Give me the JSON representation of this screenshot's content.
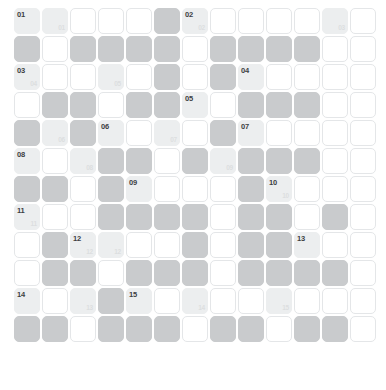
{
  "grid": {
    "columns": 13,
    "rows": 11,
    "colors": {
      "background": "#ffffff",
      "empty_cell": "#ffffff",
      "blocked_cell": "#c9cbcd",
      "clue_cell": "#eceeef",
      "cell_border": "#e4e6e8",
      "number_main": "#3d4043",
      "number_echo": "#dcdee0"
    },
    "legend": {
      "empty": "white fillable answer cell",
      "block": "shaded blocked cell",
      "clue": "light tinted numbered clue cell"
    },
    "cells": [
      [
        {
          "type": "clue",
          "num": "01"
        },
        {
          "type": "clue",
          "echo": "01"
        },
        {
          "type": "white"
        },
        {
          "type": "white"
        },
        {
          "type": "white"
        },
        {
          "type": "block"
        },
        {
          "type": "clue",
          "num": "02",
          "echo": "02"
        },
        {
          "type": "white"
        },
        {
          "type": "white"
        },
        {
          "type": "white"
        },
        {
          "type": "white"
        },
        {
          "type": "clue",
          "echo": "03"
        },
        {
          "type": "white"
        }
      ],
      [
        {
          "type": "block"
        },
        {
          "type": "white"
        },
        {
          "type": "block"
        },
        {
          "type": "block"
        },
        {
          "type": "block"
        },
        {
          "type": "block"
        },
        {
          "type": "white"
        },
        {
          "type": "block"
        },
        {
          "type": "block"
        },
        {
          "type": "block"
        },
        {
          "type": "block"
        },
        {
          "type": "white"
        },
        {
          "type": "white"
        }
      ],
      [
        {
          "type": "clue",
          "num": "03",
          "echo": "04"
        },
        {
          "type": "white"
        },
        {
          "type": "white"
        },
        {
          "type": "clue",
          "echo": "05"
        },
        {
          "type": "white"
        },
        {
          "type": "block"
        },
        {
          "type": "white"
        },
        {
          "type": "block"
        },
        {
          "type": "clue",
          "num": "04"
        },
        {
          "type": "white"
        },
        {
          "type": "white"
        },
        {
          "type": "white"
        },
        {
          "type": "white"
        }
      ],
      [
        {
          "type": "white"
        },
        {
          "type": "block"
        },
        {
          "type": "block"
        },
        {
          "type": "white"
        },
        {
          "type": "block"
        },
        {
          "type": "block"
        },
        {
          "type": "clue",
          "num": "05"
        },
        {
          "type": "white"
        },
        {
          "type": "block"
        },
        {
          "type": "block"
        },
        {
          "type": "block"
        },
        {
          "type": "white"
        },
        {
          "type": "white"
        }
      ],
      [
        {
          "type": "block"
        },
        {
          "type": "clue",
          "echo": "06"
        },
        {
          "type": "block"
        },
        {
          "type": "clue",
          "num": "06"
        },
        {
          "type": "white"
        },
        {
          "type": "clue",
          "echo": "07"
        },
        {
          "type": "white"
        },
        {
          "type": "block"
        },
        {
          "type": "clue",
          "num": "07"
        },
        {
          "type": "white"
        },
        {
          "type": "white"
        },
        {
          "type": "white"
        },
        {
          "type": "white"
        }
      ],
      [
        {
          "type": "clue",
          "num": "08"
        },
        {
          "type": "white"
        },
        {
          "type": "clue",
          "echo": "08"
        },
        {
          "type": "block"
        },
        {
          "type": "block"
        },
        {
          "type": "white"
        },
        {
          "type": "block"
        },
        {
          "type": "clue",
          "echo": "09"
        },
        {
          "type": "block"
        },
        {
          "type": "block"
        },
        {
          "type": "block"
        },
        {
          "type": "white"
        },
        {
          "type": "white"
        }
      ],
      [
        {
          "type": "block"
        },
        {
          "type": "block"
        },
        {
          "type": "white"
        },
        {
          "type": "block"
        },
        {
          "type": "clue",
          "num": "09"
        },
        {
          "type": "white"
        },
        {
          "type": "white"
        },
        {
          "type": "white"
        },
        {
          "type": "block"
        },
        {
          "type": "clue",
          "num": "10",
          "echo": "10"
        },
        {
          "type": "white"
        },
        {
          "type": "white"
        },
        {
          "type": "white"
        }
      ],
      [
        {
          "type": "clue",
          "num": "11",
          "echo": "11"
        },
        {
          "type": "white"
        },
        {
          "type": "white"
        },
        {
          "type": "block"
        },
        {
          "type": "block"
        },
        {
          "type": "block"
        },
        {
          "type": "block"
        },
        {
          "type": "white"
        },
        {
          "type": "block"
        },
        {
          "type": "block"
        },
        {
          "type": "white"
        },
        {
          "type": "block"
        },
        {
          "type": "white"
        }
      ],
      [
        {
          "type": "white"
        },
        {
          "type": "block"
        },
        {
          "type": "clue",
          "num": "12",
          "echo": "12"
        },
        {
          "type": "clue",
          "echo": "12"
        },
        {
          "type": "white"
        },
        {
          "type": "white"
        },
        {
          "type": "block"
        },
        {
          "type": "white"
        },
        {
          "type": "block"
        },
        {
          "type": "block"
        },
        {
          "type": "clue",
          "num": "13"
        },
        {
          "type": "white"
        },
        {
          "type": "white"
        }
      ],
      [
        {
          "type": "white"
        },
        {
          "type": "block"
        },
        {
          "type": "block"
        },
        {
          "type": "white"
        },
        {
          "type": "block"
        },
        {
          "type": "block"
        },
        {
          "type": "block"
        },
        {
          "type": "white"
        },
        {
          "type": "block"
        },
        {
          "type": "block"
        },
        {
          "type": "block"
        },
        {
          "type": "block"
        },
        {
          "type": "white"
        }
      ],
      [
        {
          "type": "clue",
          "num": "14"
        },
        {
          "type": "white"
        },
        {
          "type": "clue",
          "echo": "13"
        },
        {
          "type": "block"
        },
        {
          "type": "clue",
          "num": "15"
        },
        {
          "type": "white"
        },
        {
          "type": "clue",
          "echo": "14"
        },
        {
          "type": "white"
        },
        {
          "type": "white"
        },
        {
          "type": "clue",
          "echo": "15"
        },
        {
          "type": "white"
        },
        {
          "type": "white"
        },
        {
          "type": "white"
        }
      ],
      [
        {
          "type": "block"
        },
        {
          "type": "block"
        },
        {
          "type": "white"
        },
        {
          "type": "block"
        },
        {
          "type": "block"
        },
        {
          "type": "block"
        },
        {
          "type": "white"
        },
        {
          "type": "block"
        },
        {
          "type": "block"
        },
        {
          "type": "white"
        },
        {
          "type": "block"
        },
        {
          "type": "block"
        },
        {
          "type": "white"
        }
      ]
    ]
  }
}
